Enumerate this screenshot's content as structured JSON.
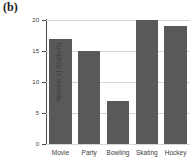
{
  "figure": {
    "panel_label": "(b)"
  },
  "chart_data": {
    "type": "bar",
    "title": "",
    "subtitle": "",
    "xlabel": "",
    "ylabel": "Number of Students",
    "categories": [
      "Movie",
      "Party",
      "Bowling",
      "Skating",
      "Hockey"
    ],
    "values": [
      17,
      15,
      7,
      20,
      19
    ],
    "series": [
      {
        "name": "Number of Students",
        "values": [
          17,
          15,
          7,
          20,
          19
        ]
      }
    ],
    "ylim": [
      0,
      20
    ],
    "yticks": [
      0,
      5,
      10,
      15,
      20
    ],
    "ytick_labels": [
      "0",
      "5",
      "10",
      "15",
      "20"
    ],
    "grid": true,
    "grid_axis": "y",
    "legend": false,
    "legend_position": "none",
    "bar_color": "#595959",
    "grid_color": "#d6d6d6",
    "axis_color": "#4a4a4a",
    "text_color": "#3d3d3d",
    "background": "#ffffff",
    "annotations": []
  }
}
